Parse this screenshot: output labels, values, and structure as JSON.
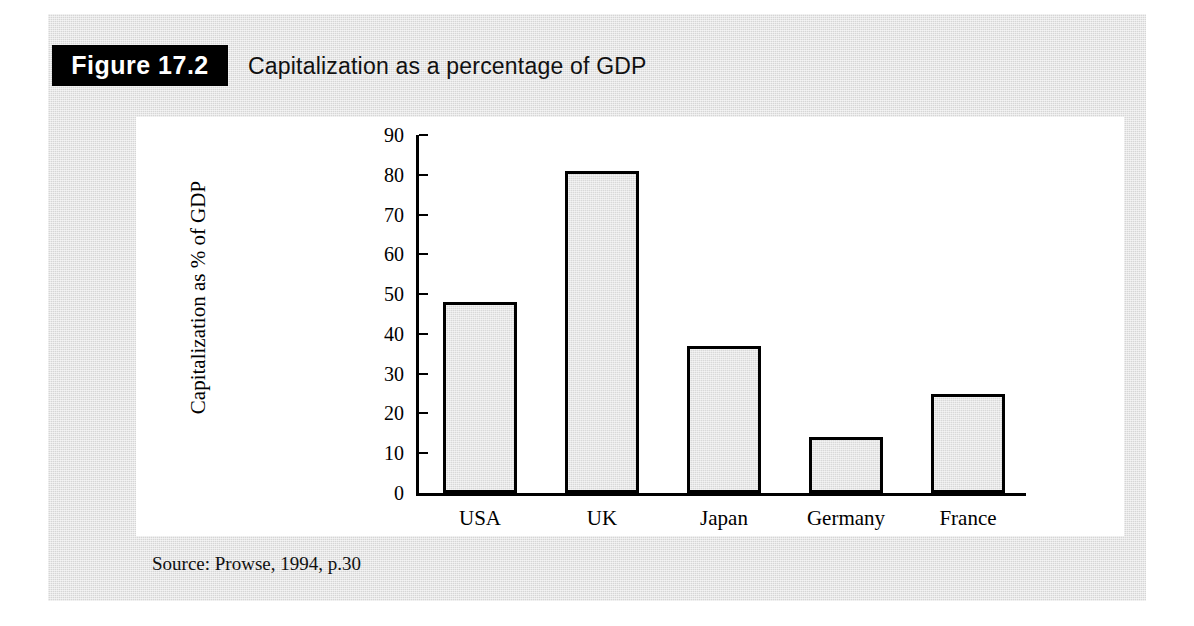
{
  "figure": {
    "badge_label": "Figure 17.2",
    "title": "Capitalization as a percentage of GDP",
    "source": "Source: Prowse, 1994, p.30"
  },
  "colors": {
    "badge_background": "#000000",
    "badge_text": "#ffffff",
    "panel_background": "#d6d6d6",
    "card_background": "#ffffff",
    "bar_fill": "#d9d9d9",
    "bar_outline": "#000000",
    "axis": "#000000"
  },
  "chart_data": {
    "type": "bar",
    "title": "Capitalization as a percentage of GDP",
    "categories": [
      "USA",
      "UK",
      "Japan",
      "Germany",
      "France"
    ],
    "values": [
      48,
      81,
      37,
      14,
      25
    ],
    "series": [
      {
        "name": "Capitalization as % of GDP",
        "values": [
          48,
          81,
          37,
          14,
          25
        ]
      }
    ],
    "xlabel": "",
    "ylabel": "Capitalization as % of GDP",
    "ylim": [
      0,
      90
    ],
    "ytick_step": 10,
    "yticks": [
      0,
      10,
      20,
      30,
      40,
      50,
      60,
      70,
      80,
      90
    ],
    "ytick_labels": [
      "0",
      "10",
      "20",
      "30",
      "40",
      "50",
      "60",
      "70",
      "80",
      "90"
    ],
    "grid": false,
    "legend": false,
    "source": "Source: Prowse, 1994, p.30"
  }
}
